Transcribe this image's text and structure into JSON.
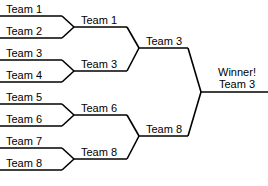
{
  "diagram": {
    "line_color": "#000000",
    "background_color": "#ffffff",
    "text_color": "#000000"
  },
  "rounds": {
    "round1": {
      "name": "First Round",
      "slots": [
        {
          "label": "Team 1"
        },
        {
          "label": "Team 2"
        },
        {
          "label": "Team 3"
        },
        {
          "label": "Team 4"
        },
        {
          "label": "Team 5"
        },
        {
          "label": "Team 6"
        },
        {
          "label": "Team 7"
        },
        {
          "label": "Team 8"
        }
      ]
    },
    "round2": {
      "name": "Quarterfinal Winners",
      "slots": [
        {
          "label": "Team 1"
        },
        {
          "label": "Team 3"
        },
        {
          "label": "Team 6"
        },
        {
          "label": "Team 8"
        }
      ]
    },
    "round3": {
      "name": "Semifinal Winners",
      "slots": [
        {
          "label": "Team 3"
        },
        {
          "label": "Team 8"
        }
      ]
    },
    "final": {
      "name": "Champion",
      "title": "Winner!",
      "team": "Team 3"
    }
  }
}
